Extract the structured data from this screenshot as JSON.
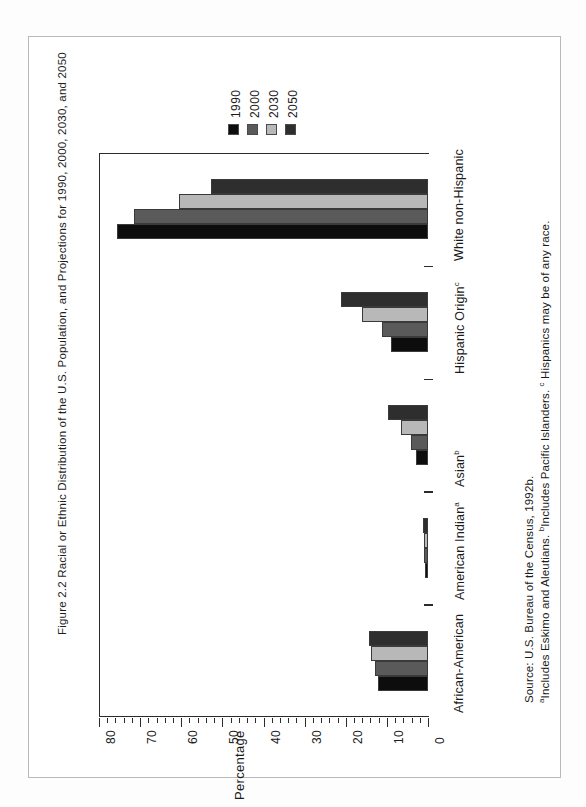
{
  "figure": {
    "caption": "Figure 2.2  Racial or Ethnic Distribution of the U.S. Population, and Projections for 1990, 2000, 2030, and 2050",
    "ghost_text": "Hispanic"
  },
  "legend": {
    "position": "top-right",
    "entries": [
      {
        "label": "1990",
        "color": "#0d0d0d"
      },
      {
        "label": "2000",
        "color": "#5a5a5a"
      },
      {
        "label": "2030",
        "color": "#b8b8b8"
      },
      {
        "label": "2050",
        "color": "#2e2e2e"
      }
    ]
  },
  "axis": {
    "title": "Percentage",
    "ticklabels": [
      "80",
      "70",
      "60",
      "50",
      "40",
      "30",
      "20",
      "10",
      "0"
    ]
  },
  "notes": {
    "source": "Source: U.S. Bureau of the Census, 1992b.",
    "footnotes": "aIncludes Eskimo and Aleutians.  bIncludes Pacific Islanders.  c Hispanics may be of any race.",
    "fn_a_marker": "a",
    "fn_a_text": "Includes Eskimo and Aleutians. ",
    "fn_b_marker": "b",
    "fn_b_text": "Includes Pacific Islanders. ",
    "fn_c_marker": "c",
    "fn_c_text": " Hispanics may be of any race."
  },
  "chart_data": {
    "type": "bar",
    "title": "Figure 2.2  Racial or Ethnic Distribution of the U.S. Population, and Projections for 1990, 2000, 2030, and 2050",
    "orientation": "horizontal",
    "xlabel": "",
    "ylabel": "Percentage",
    "ylim": [
      0,
      80
    ],
    "grid": false,
    "legend_position": "top-right",
    "categories": [
      "African-American",
      "American Indian",
      "Asian",
      "Hispanic Origin",
      "White non-Hispanic"
    ],
    "category_footnotes": [
      "",
      "a",
      "b",
      "c",
      ""
    ],
    "series": [
      {
        "name": "1990",
        "color": "#0d0d0d",
        "values": [
          12.1,
          0.8,
          3.0,
          9.0,
          75.7
        ]
      },
      {
        "name": "2000",
        "color": "#5a5a5a",
        "values": [
          12.8,
          0.9,
          4.1,
          11.3,
          71.6
        ]
      },
      {
        "name": "2030",
        "color": "#b8b8b8",
        "values": [
          13.9,
          1.0,
          6.6,
          16.0,
          60.5
        ]
      },
      {
        "name": "2050",
        "color": "#2e2e2e",
        "values": [
          14.4,
          1.2,
          9.7,
          21.1,
          52.7
        ]
      }
    ]
  }
}
